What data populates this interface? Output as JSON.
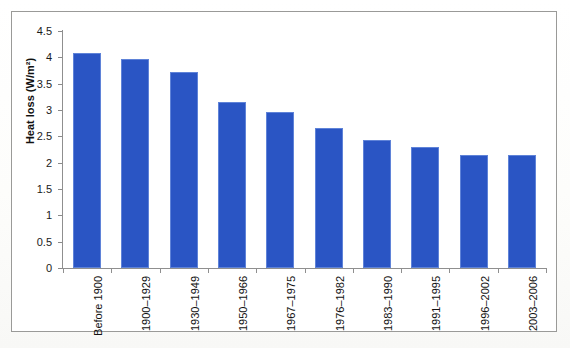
{
  "chart_data": {
    "type": "bar",
    "title": "",
    "xlabel": "",
    "ylabel": "Heat loss (W/m²)",
    "ylim": [
      0,
      4.5
    ],
    "yticks": [
      "0",
      "0.5",
      "1",
      "1.5",
      "2",
      "2.5",
      "3",
      "3.5",
      "4",
      "4.5"
    ],
    "ytick_values": [
      0,
      0.5,
      1,
      1.5,
      2,
      2.5,
      3,
      3.5,
      4,
      4.5
    ],
    "grid": false,
    "legend": false,
    "bar_color": "#2a55c4",
    "categories": [
      "Before 1900",
      "1900–1929",
      "1930–1949",
      "1950–1966",
      "1967–1975",
      "1976–1982",
      "1983–1990",
      "1991–1995",
      "1996–2002",
      "2003–2006"
    ],
    "values": [
      4.08,
      3.97,
      3.72,
      3.15,
      2.97,
      2.66,
      2.44,
      2.3,
      2.14,
      2.15
    ]
  }
}
